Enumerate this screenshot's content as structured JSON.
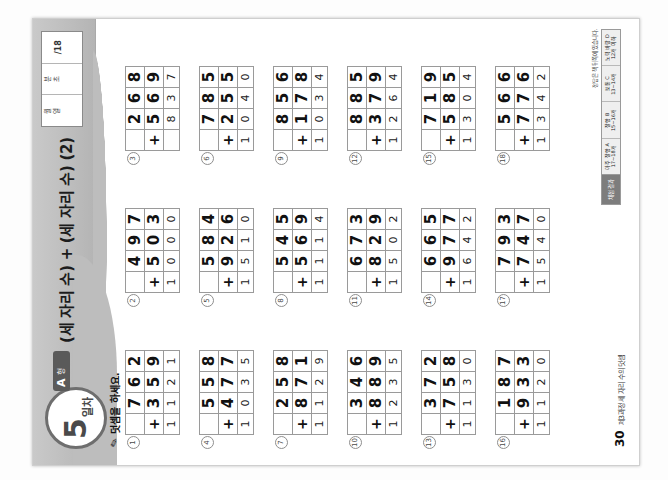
{
  "document": {
    "type": "korean-math-workbook-page",
    "orientation_note": "page photographed rotated 90 degrees counter-clockwise"
  },
  "header": {
    "day_number": "5",
    "day_suffix": "일차",
    "form_letter": "A",
    "form_label": "형",
    "title": "(세 자리 수) + (세 자리 수) (2)"
  },
  "stamp_box": {
    "cells": [
      {
        "label_top": "월",
        "label_bottom": "일",
        "value": ""
      },
      {
        "label_top": "분",
        "label_bottom": "초",
        "value": ""
      },
      {
        "label_top": "",
        "label_bottom": "",
        "value": "/18"
      }
    ]
  },
  "instruction": {
    "icon": "pencil-icon",
    "text": "덧셈을 하세요."
  },
  "problems": [
    {
      "no": "1",
      "addend1": "762",
      "addend2": "359",
      "sum": "1121"
    },
    {
      "no": "2",
      "addend1": "497",
      "addend2": "503",
      "sum": "1000"
    },
    {
      "no": "3",
      "addend1": "268",
      "addend2": "569",
      "sum": "837"
    },
    {
      "no": "4",
      "addend1": "558",
      "addend2": "477",
      "sum": "1035"
    },
    {
      "no": "5",
      "addend1": "584",
      "addend2": "926",
      "sum": "1510"
    },
    {
      "no": "6",
      "addend1": "785",
      "addend2": "255",
      "sum": "1040"
    },
    {
      "no": "7",
      "addend1": "258",
      "addend2": "871",
      "sum": "1129"
    },
    {
      "no": "8",
      "addend1": "545",
      "addend2": "569",
      "sum": "1114"
    },
    {
      "no": "9",
      "addend1": "856",
      "addend2": "178",
      "sum": "1034"
    },
    {
      "no": "10",
      "addend1": "346",
      "addend2": "889",
      "sum": "1235"
    },
    {
      "no": "11",
      "addend1": "673",
      "addend2": "829",
      "sum": "1502"
    },
    {
      "no": "12",
      "addend1": "885",
      "addend2": "379",
      "sum": "1264"
    },
    {
      "no": "13",
      "addend1": "372",
      "addend2": "758",
      "sum": "1130"
    },
    {
      "no": "14",
      "addend1": "665",
      "addend2": "977",
      "sum": "1642"
    },
    {
      "no": "15",
      "addend1": "719",
      "addend2": "585",
      "sum": "1304"
    },
    {
      "no": "16",
      "addend1": "187",
      "addend2": "933",
      "sum": "1120"
    },
    {
      "no": "17",
      "addend1": "793",
      "addend2": "747",
      "sum": "1540"
    },
    {
      "no": "18",
      "addend1": "566",
      "addend2": "776",
      "sum": "1342"
    }
  ],
  "operator": "+",
  "footer": {
    "page_number": "30",
    "text": "제3과정 세 자리 수의 덧셈"
  },
  "answer_strip": {
    "caption": "정답은 책 뒤쪽에 있습니다.",
    "head": "채점 결과",
    "cells": [
      "아주 잘함 A\n17~18개",
      "잘함 B\n15~16개",
      "보통 C\n13~14개",
      "노력 바람 D\n12개 이하"
    ]
  },
  "colors": {
    "band": "#bdbdbd",
    "ink": "#111111",
    "rule": "#9a9a9a",
    "badge_border": "#6e6e6e",
    "tab_bg": "#5a5a5a"
  }
}
